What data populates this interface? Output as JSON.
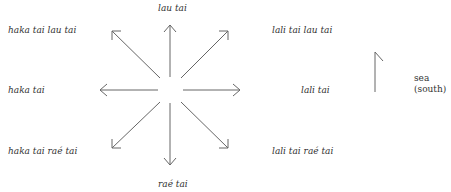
{
  "diagram": {
    "labels": {
      "north": "lau tai",
      "northwest": "haka tai lau tai",
      "northeast": "lali tai lau tai",
      "west": "haka tai",
      "east": "lali tai",
      "southwest": "haka tai raé tai",
      "southeast": "lali tai raé tai",
      "south": "raé tai"
    },
    "reference": {
      "line1": "sea",
      "line2": "(south)"
    },
    "arrow_color": "#666666",
    "text_color": "#333333"
  }
}
